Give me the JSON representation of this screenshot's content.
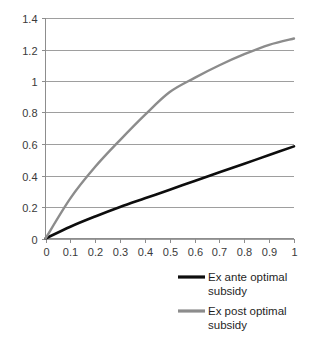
{
  "chart_data": {
    "type": "line",
    "title": "",
    "xlabel": "",
    "ylabel": "",
    "xlim": [
      0,
      1
    ],
    "ylim": [
      0,
      1.4
    ],
    "grid": true,
    "legend_position": "bottom-right",
    "x_ticks": [
      "0",
      "0.1",
      "0.2",
      "0.3",
      "0.4",
      "0.5",
      "0.6",
      "0.7",
      "0.8",
      "0.9",
      "1"
    ],
    "x_tick_values": [
      0,
      0.1,
      0.2,
      0.3,
      0.4,
      0.5,
      0.6,
      0.7,
      0.8,
      0.9,
      1
    ],
    "y_ticks": [
      "0",
      "0.2",
      "0.4",
      "0.6",
      "0.8",
      "1",
      "1.2",
      "1.4"
    ],
    "y_tick_values": [
      0,
      0.2,
      0.4,
      0.6,
      0.8,
      1.0,
      1.2,
      1.4
    ],
    "x": [
      0,
      0.1,
      0.2,
      0.3,
      0.4,
      0.5,
      0.6,
      0.7,
      0.8,
      0.9,
      1
    ],
    "series": [
      {
        "name": "Ex ante optimal subsidy",
        "color": "#0d0d0d",
        "width": 2.6,
        "values": [
          0,
          0.075,
          0.14,
          0.2,
          0.255,
          0.31,
          0.365,
          0.42,
          0.475,
          0.53,
          0.585
        ]
      },
      {
        "name": "Ex post optimal subsidy",
        "color": "#8c8c8c",
        "width": 2.4,
        "values": [
          0,
          0.255,
          0.455,
          0.625,
          0.785,
          0.93,
          1.02,
          1.1,
          1.17,
          1.23,
          1.27
        ]
      }
    ]
  },
  "legend": {
    "items": [
      {
        "label_line1": "Ex ante optimal",
        "label_line2": "subsidy",
        "color": "#0d0d0d"
      },
      {
        "label_line1": "Ex post optimal",
        "label_line2": "subsidy",
        "color": "#8c8c8c"
      }
    ]
  }
}
